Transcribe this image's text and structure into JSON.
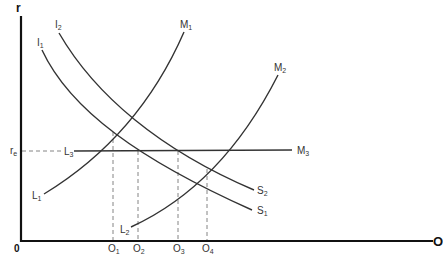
{
  "diagram": {
    "axes": {
      "y_label": "r",
      "x_label": "O",
      "origin_label": "0"
    },
    "level_label": "r",
    "level_label_sub": "e",
    "curves": {
      "I1": {
        "name": "I",
        "sub": "1"
      },
      "I2": {
        "name": "I",
        "sub": "2"
      },
      "M1": {
        "name": "M",
        "sub": "1"
      },
      "M2": {
        "name": "M",
        "sub": "2"
      },
      "M3": {
        "name": "M",
        "sub": "3"
      },
      "L1": {
        "name": "L",
        "sub": "1"
      },
      "L2": {
        "name": "L",
        "sub": "2"
      },
      "L3": {
        "name": "L",
        "sub": "3"
      },
      "S1": {
        "name": "S",
        "sub": "1"
      },
      "S2": {
        "name": "S",
        "sub": "2"
      }
    },
    "x_ticks": [
      {
        "name": "O",
        "sub": "1"
      },
      {
        "name": "O",
        "sub": "2"
      },
      {
        "name": "O",
        "sub": "3"
      },
      {
        "name": "O",
        "sub": "4"
      }
    ]
  }
}
